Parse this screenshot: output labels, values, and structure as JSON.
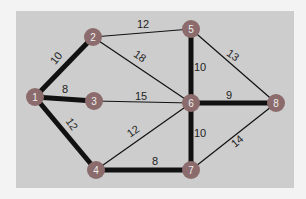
{
  "diagram": {
    "type": "weighted-graph",
    "colors": {
      "background": "#f3f3f3",
      "panel": "#cdcdcd",
      "node": "#8b6b6b",
      "edge": "#111111"
    },
    "nodes": [
      {
        "id": "1",
        "x": 35,
        "y": 97
      },
      {
        "id": "2",
        "x": 93,
        "y": 37
      },
      {
        "id": "3",
        "x": 94,
        "y": 101
      },
      {
        "id": "4",
        "x": 96,
        "y": 170
      },
      {
        "id": "5",
        "x": 191,
        "y": 29
      },
      {
        "id": "6",
        "x": 191,
        "y": 103
      },
      {
        "id": "7",
        "x": 191,
        "y": 170
      },
      {
        "id": "8",
        "x": 276,
        "y": 103
      }
    ],
    "edges": [
      {
        "from": "1",
        "to": "2",
        "weight": "10",
        "highlighted": true
      },
      {
        "from": "1",
        "to": "3",
        "weight": "8",
        "highlighted": true
      },
      {
        "from": "1",
        "to": "4",
        "weight": "12",
        "highlighted": true
      },
      {
        "from": "2",
        "to": "5",
        "weight": "12",
        "highlighted": false
      },
      {
        "from": "2",
        "to": "6",
        "weight": "18",
        "highlighted": false
      },
      {
        "from": "3",
        "to": "6",
        "weight": "15",
        "highlighted": false
      },
      {
        "from": "4",
        "to": "6",
        "weight": "12",
        "highlighted": false
      },
      {
        "from": "4",
        "to": "7",
        "weight": "8",
        "highlighted": true
      },
      {
        "from": "5",
        "to": "6",
        "weight": "10",
        "highlighted": true
      },
      {
        "from": "5",
        "to": "8",
        "weight": "13",
        "highlighted": false
      },
      {
        "from": "6",
        "to": "8",
        "weight": "9",
        "highlighted": true
      },
      {
        "from": "6",
        "to": "7",
        "weight": "10",
        "highlighted": true
      },
      {
        "from": "7",
        "to": "8",
        "weight": "14",
        "highlighted": false
      }
    ],
    "labels": [
      {
        "text": "10",
        "x": 56,
        "y": 62,
        "rot": -50
      },
      {
        "text": "8",
        "x": 65,
        "y": 93,
        "rot": 0
      },
      {
        "text": "12",
        "x": 72,
        "y": 128,
        "rot": 55
      },
      {
        "text": "12",
        "x": 143,
        "y": 28,
        "rot": 0
      },
      {
        "text": "18",
        "x": 140,
        "y": 60,
        "rot": 35
      },
      {
        "text": "15",
        "x": 141,
        "y": 100,
        "rot": 0
      },
      {
        "text": "12",
        "x": 133,
        "y": 135,
        "rot": -35
      },
      {
        "text": "8",
        "x": 155,
        "y": 165,
        "rot": 0
      },
      {
        "text": "10",
        "x": 200,
        "y": 71,
        "rot": 0
      },
      {
        "text": "13",
        "x": 233,
        "y": 59,
        "rot": 35
      },
      {
        "text": "9",
        "x": 229,
        "y": 99,
        "rot": 0
      },
      {
        "text": "10",
        "x": 200,
        "y": 137,
        "rot": 0
      },
      {
        "text": "14",
        "x": 237,
        "y": 145,
        "rot": -40
      }
    ]
  }
}
